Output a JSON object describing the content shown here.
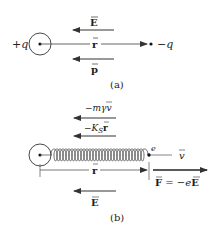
{
  "panel_a": {
    "caption": "(a)",
    "positive_charge_label": "+q",
    "negative_charge_label": "−q",
    "field_label": "E",
    "separation_label": "r",
    "dipole_moment_label": "p"
  },
  "panel_b": {
    "caption": "(b)",
    "damping_force_label": "−mγv",
    "spring_force_prefix": "−K",
    "spring_force_subscript": "S",
    "spring_force_vector": "r",
    "electron_label": "e",
    "velocity_label": "v",
    "displacement_label": "r",
    "applied_force_label_F": "F",
    "applied_force_label_eq": " = −e",
    "applied_force_label_E": "E",
    "field_label": "E",
    "spring_coils": 15
  },
  "colors": {
    "line": "#444444",
    "arrow": "#333333",
    "text": "#222222",
    "background": "#ffffff"
  }
}
